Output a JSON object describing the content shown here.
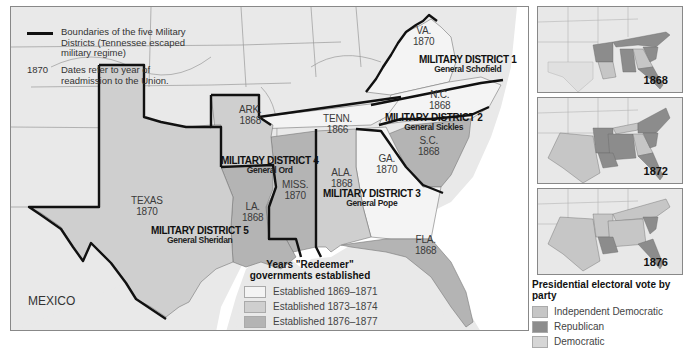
{
  "main_map": {
    "legend": {
      "boundary_label": "Boundaries of the five Military Districts (Tennessee escaped military regime)",
      "date_sample": "1870",
      "date_label": "Dates refer to year of readmission to the Union."
    },
    "states": [
      {
        "name": "VA.",
        "year": "1870"
      },
      {
        "name": "N.C.",
        "year": "1868"
      },
      {
        "name": "TENN.",
        "year": "1866"
      },
      {
        "name": "S.C.",
        "year": "1868"
      },
      {
        "name": "GA.",
        "year": "1870"
      },
      {
        "name": "ALA.",
        "year": "1868"
      },
      {
        "name": "MISS.",
        "year": "1870"
      },
      {
        "name": "ARK.",
        "year": "1868"
      },
      {
        "name": "LA.",
        "year": "1868"
      },
      {
        "name": "TEXAS",
        "year": "1870"
      },
      {
        "name": "FLA.",
        "year": "1868"
      }
    ],
    "districts": [
      {
        "name": "MILITARY DISTRICT 1",
        "general": "General Schofield"
      },
      {
        "name": "MILITARY DISTRICT 2",
        "general": "General Sickles"
      },
      {
        "name": "MILITARY DISTRICT 3",
        "general": "General Pope"
      },
      {
        "name": "MILITARY DISTRICT 4",
        "general": "General Ord"
      },
      {
        "name": "MILITARY DISTRICT 5",
        "general": "General Sheridan"
      }
    ],
    "country_label": "MEXICO",
    "redeemer_legend": {
      "title": "Years \"Redeemer\" governments established",
      "items": [
        {
          "label": "Established 1869–1871",
          "color": "#f4f4f4"
        },
        {
          "label": "Established 1873–1874",
          "color": "#cfcfcf"
        },
        {
          "label": "Established 1876–1877",
          "color": "#b4b4b4"
        }
      ]
    }
  },
  "insets": [
    {
      "year": "1868"
    },
    {
      "year": "1872"
    },
    {
      "year": "1876"
    }
  ],
  "presidential_legend": {
    "title": "Presidential electoral vote by party",
    "items": [
      {
        "label": "Independent Democratic",
        "color": "#c6c6c6"
      },
      {
        "label": "Republican",
        "color": "#8c8c8c"
      },
      {
        "label": "Democratic",
        "color": "#d6d6d6"
      }
    ]
  },
  "colors": {
    "background_land": "#e9e9e9",
    "redeemer_early": "#f4f4f4",
    "redeemer_mid": "#cfcfcf",
    "redeemer_late": "#b4b4b4",
    "boundary": "#111111",
    "water": "#ffffff"
  }
}
